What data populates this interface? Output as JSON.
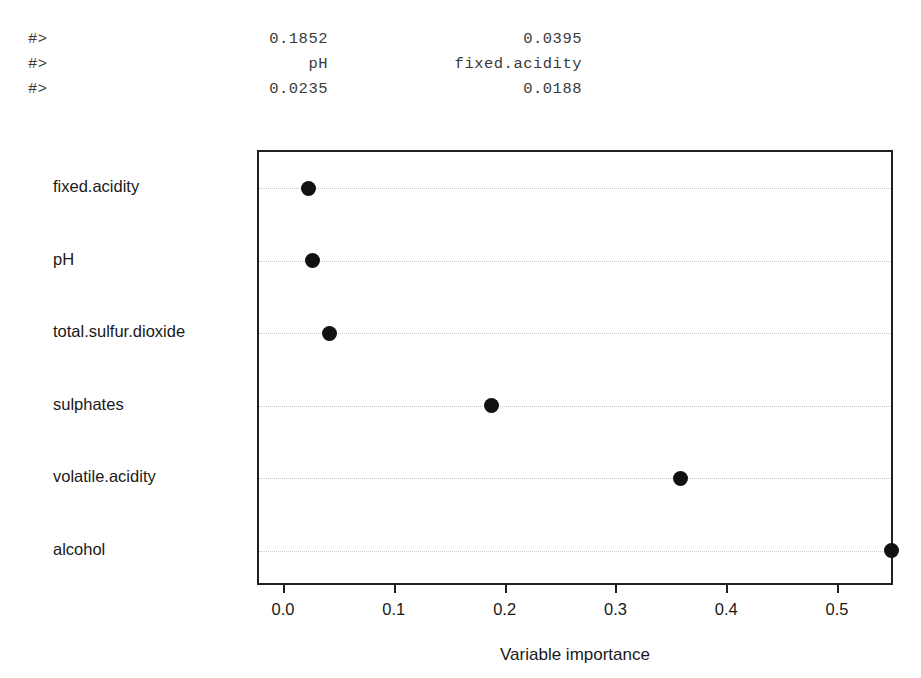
{
  "console": {
    "lines": [
      {
        "prompt": "#>",
        "col1": "0.1852",
        "col2": "0.0395"
      },
      {
        "prompt": "#>",
        "col1": "pH",
        "col2": "fixed.acidity"
      },
      {
        "prompt": "#>",
        "col1": "0.0235",
        "col2": "0.0188"
      }
    ]
  },
  "chart_data": {
    "type": "scatter",
    "title": "",
    "xlabel": "Variable importance",
    "ylabel": "",
    "orientation": "horizontal",
    "grid": true,
    "grid_style": "dotted",
    "legend": false,
    "xlim": [
      -0.0235,
      0.5505
    ],
    "xticks": [
      0.0,
      0.1,
      0.2,
      0.3,
      0.4,
      0.5
    ],
    "xticklabels": [
      "0.0",
      "0.1",
      "0.2",
      "0.3",
      "0.4",
      "0.5"
    ],
    "categories": [
      "fixed.acidity",
      "pH",
      "total.sulfur.dioxide",
      "sulphates",
      "volatile.acidity",
      "alcohol"
    ],
    "values": [
      0.0208,
      0.0244,
      0.0397,
      0.1859,
      0.3565,
      0.5469
    ],
    "marker": "filled-circle",
    "marker_color": "#111111",
    "marker_size_px": 15,
    "frame_color": "#231f20",
    "grid_color": "#c9c9c9"
  }
}
